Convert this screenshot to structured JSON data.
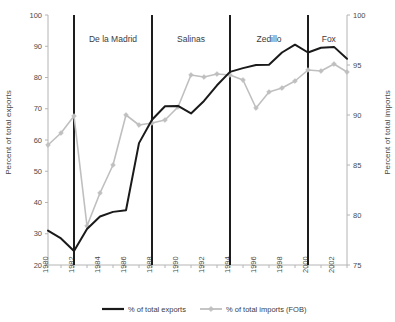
{
  "chart_data": {
    "type": "line",
    "title": "",
    "xlabel": "",
    "ylabel": "Percent of total exports",
    "ylabel_right": "Percent of total imports",
    "grid": false,
    "legend_position": "bottom",
    "x": [
      1980,
      1981,
      1982,
      1983,
      1984,
      1985,
      1986,
      1987,
      1988,
      1989,
      1990,
      1991,
      1992,
      1993,
      1994,
      1995,
      1996,
      1997,
      1998,
      1999,
      2000,
      2001,
      2002,
      2003
    ],
    "xtick_labels": [
      "1980",
      "1982",
      "1984",
      "1986",
      "1988",
      "1990",
      "1992",
      "1994",
      "1996",
      "1998",
      "2000",
      "2002"
    ],
    "xlim": [
      1980,
      2003
    ],
    "ylim": [
      20,
      100
    ],
    "ytick_labels": [
      "20",
      "30",
      "40",
      "50",
      "60",
      "70",
      "80",
      "90",
      "100"
    ],
    "ylim_right": [
      75,
      100
    ],
    "ytick_labels_right": [
      "75",
      "80",
      "85",
      "90",
      "95",
      "100"
    ],
    "series": [
      {
        "name": "% of total exports",
        "axis": "left",
        "color": "#1a1a1a",
        "marker": "none",
        "values": [
          31.0,
          28.5,
          24.5,
          31.5,
          35.5,
          37.0,
          37.5,
          59.0,
          66.5,
          70.8,
          70.9,
          68.5,
          72.5,
          77.5,
          81.8,
          83.0,
          84.0,
          84.1,
          88.0,
          90.5,
          88.0,
          89.5,
          89.8,
          86.0
        ]
      },
      {
        "name": "% of total imports (FOB)",
        "axis": "right",
        "color": "#bfbfbf",
        "marker": "diamond",
        "values": [
          87.0,
          88.2,
          89.9,
          78.9,
          82.2,
          85.0,
          90.0,
          89.0,
          89.2,
          89.5,
          90.8,
          94.0,
          93.8,
          94.1,
          94.0,
          93.5,
          90.7,
          92.3,
          92.7,
          93.4,
          94.5,
          94.4,
          95.1,
          94.3
        ]
      }
    ],
    "annotations": [
      {
        "label": "De la Madrid",
        "x_start": 1982,
        "x_end": 1988,
        "x_center": 1985
      },
      {
        "label": "Salinas",
        "x_start": 1988,
        "x_end": 1994,
        "x_center": 1991
      },
      {
        "label": "Zedillo",
        "x_start": 1994,
        "x_end": 2000,
        "x_center": 1997
      },
      {
        "label": "Fox",
        "x_start": 2000,
        "x_end": 2003,
        "x_center": 2001.6
      }
    ],
    "dividers": [
      1982,
      1988,
      1994,
      2000
    ],
    "legend": [
      {
        "label": "% of total exports",
        "color": "#1a1a1a",
        "marker": "none"
      },
      {
        "label": "% of total imports (FOB)",
        "color": "#bfbfbf",
        "marker": "diamond"
      }
    ]
  }
}
